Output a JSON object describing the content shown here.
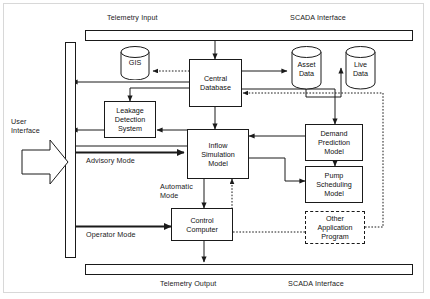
{
  "diagram": {
    "bars": [
      {
        "id": "telemetry-input-bar",
        "label_left": "Telemetry Input",
        "label_right": "SCADA Interface",
        "position": "top"
      },
      {
        "id": "telemetry-output-bar",
        "label_left": "Telemetry Output",
        "label_right": "SCADA Interface",
        "position": "bottom"
      }
    ],
    "labels": {
      "telemetry_input": "Telemetry Input",
      "scada_interface_top": "SCADA Interface",
      "telemetry_output": "Telemetry Output",
      "scada_interface_bottom": "SCADA Interface",
      "user_interface": "User\nInterface",
      "user_interface_line1": "User",
      "user_interface_line2": "Interface",
      "advisory_mode": "Advisory Mode",
      "automatic_mode_line1": "Automatic",
      "automatic_mode_line2": "Mode",
      "operator_mode": "Operator Mode"
    },
    "nodes": [
      {
        "id": "central-database",
        "label": "Central\nDatabase",
        "line1": "Central",
        "line2": "Database",
        "shape": "rect",
        "border": "solid"
      },
      {
        "id": "leakage-detection-system",
        "label": "Leakage\nDetection\nSystem",
        "line1": "Leakage",
        "line2": "Detection",
        "line3": "System",
        "shape": "rect",
        "border": "solid"
      },
      {
        "id": "inflow-simulation-model",
        "label": "Inflow\nSimulation\nModel",
        "line1": "Inflow",
        "line2": "Simulation",
        "line3": "Model",
        "shape": "rect",
        "border": "solid"
      },
      {
        "id": "control-computer",
        "label": "Control\nComputer",
        "line1": "Control",
        "line2": "Computer",
        "shape": "rect",
        "border": "solid"
      },
      {
        "id": "demand-prediction-model",
        "label": "Demand\nPrediction\nModel",
        "line1": "Demand",
        "line2": "Prediction",
        "line3": "Model",
        "shape": "rect",
        "border": "solid"
      },
      {
        "id": "pump-scheduling-model",
        "label": "Pump\nScheduling\nModel",
        "line1": "Pump",
        "line2": "Scheduling",
        "line3": "Model",
        "shape": "rect",
        "border": "solid"
      },
      {
        "id": "other-application-program",
        "label": "Other\nApplication\nProgram",
        "line1": "Other",
        "line2": "Application",
        "line3": "Program",
        "shape": "rect",
        "border": "dashed"
      }
    ],
    "datastores": [
      {
        "id": "gis-store",
        "label": "GIS",
        "line1": "GIS",
        "line2": "",
        "shape": "cylinder"
      },
      {
        "id": "asset-data-store",
        "label": "Asset\nData",
        "line1": "Asset",
        "line2": "Data",
        "shape": "cylinder"
      },
      {
        "id": "live-data-store",
        "label": "Live\nData",
        "line1": "Live",
        "line2": "Data",
        "shape": "cylinder"
      }
    ],
    "connectors": [
      {
        "from": "telemetry-input-bar",
        "to": "central-database",
        "style": "solid"
      },
      {
        "from": "central-database",
        "to": "gis-store",
        "style": "dotted"
      },
      {
        "from": "central-database",
        "to": "asset-data-store",
        "style": "solid",
        "bidirectional": true
      },
      {
        "from": "asset-data-store",
        "to": "live-data-store",
        "style": "solid"
      },
      {
        "from": "central-database",
        "to": "user-interface-bus",
        "style": "solid"
      },
      {
        "from": "central-database",
        "to": "leakage-detection-system",
        "style": "solid"
      },
      {
        "from": "leakage-detection-system",
        "to": "user-interface-bus",
        "style": "solid"
      },
      {
        "from": "central-database",
        "to": "inflow-simulation-model",
        "style": "solid",
        "bidirectional": true
      },
      {
        "from": "inflow-simulation-model",
        "to": "leakage-detection-system",
        "style": "solid"
      },
      {
        "from": "demand-prediction-model",
        "to": "inflow-simulation-model",
        "style": "solid"
      },
      {
        "from": "demand-prediction-model",
        "to": "pump-scheduling-model",
        "style": "solid",
        "bidirectional": true
      },
      {
        "from": "pump-scheduling-model",
        "to": "inflow-simulation-model",
        "style": "solid"
      },
      {
        "from": "central-database",
        "to": "demand-prediction-model",
        "style": "solid"
      },
      {
        "from": "other-application-program",
        "to": "central-database",
        "style": "dotted"
      },
      {
        "from": "other-application-program",
        "to": "inflow-simulation-model",
        "style": "dotted"
      },
      {
        "from": "inflow-simulation-model",
        "to": "control-computer",
        "style": "solid",
        "label": "Automatic Mode"
      },
      {
        "from": "user-interface-bus",
        "to": "inflow-simulation-model",
        "style": "thick",
        "label": "Advisory Mode"
      },
      {
        "from": "user-interface-bus",
        "to": "control-computer",
        "style": "thick",
        "label": "Operator Mode"
      },
      {
        "from": "control-computer",
        "to": "telemetry-output-bar",
        "style": "solid"
      }
    ],
    "colors": {
      "line": "#1a1a1a",
      "background": "#ffffff",
      "frame": "#d8d8d8",
      "text": "#111111"
    }
  }
}
